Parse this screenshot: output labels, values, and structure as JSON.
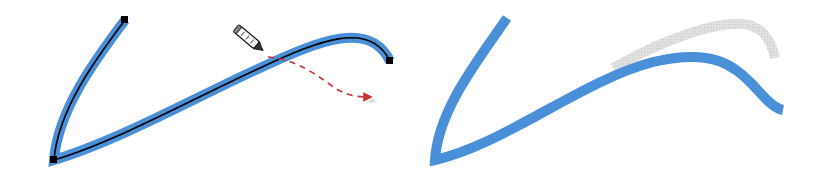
{
  "figure": {
    "panels": [
      {
        "id": "before",
        "stroke_color": "#4a90d9",
        "path_color": "#000000",
        "arrow_color": "#cc3333",
        "anchor_color": "#000000",
        "elements": [
          "blue-stroke",
          "black-center-path",
          "three-anchor-points",
          "pencil-cursor",
          "dashed-red-arrow"
        ]
      },
      {
        "id": "after",
        "stroke_color": "#4a90d9",
        "ghost_color": "#d3d3d3",
        "elements": [
          "reshaped-blue-stroke",
          "gray-original-stroke-ghost"
        ]
      }
    ]
  }
}
